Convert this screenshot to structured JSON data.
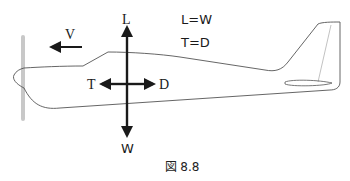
{
  "diagram": {
    "forces": {
      "lift": "L",
      "weight": "W",
      "thrust": "T",
      "drag": "D",
      "velocity": "V"
    },
    "equations": [
      "L=W",
      "T=D"
    ],
    "caption": "図 8.8"
  },
  "colors": {
    "stroke": "#1a1a1a",
    "outline": "#555555",
    "propeller": "#c8c8c8"
  }
}
